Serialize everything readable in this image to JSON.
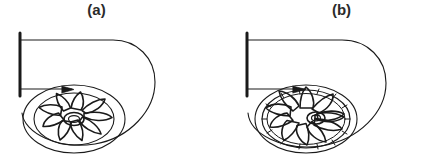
{
  "figure": {
    "background_color": "#ffffff",
    "line_color": "#1a1a1a",
    "label_color": "#2b2b2b",
    "panel_count": 2
  },
  "panels": [
    {
      "id": "a",
      "label": "(a)",
      "impeller_type": "backward-curved",
      "blade_count": 9,
      "description": "Centrifugal fan with volute casing and backward-curved impeller blades",
      "parts": {
        "discharge_flange": "discharge-flange",
        "discharge_duct": "discharge-duct",
        "volute_casing": "volute-casing",
        "cutwater_tongue": "cutwater-tongue",
        "impeller": "impeller",
        "hub": "hub"
      },
      "geometry": {
        "flange_x": 20,
        "flange_top_y": 33,
        "flange_bottom_y": 96,
        "duct_top_y": 40,
        "duct_bottom_y": 89,
        "impeller_center_x": 74,
        "impeller_center_y": 119,
        "impeller_rx": 40,
        "impeller_ry": 26,
        "shroud_rx": 51,
        "shroud_ry": 34,
        "hub_rx": 10,
        "hub_ry": 6.5
      }
    },
    {
      "id": "b",
      "label": "(b)",
      "impeller_type": "forward-curved",
      "blade_count": 11,
      "description": "Centrifugal fan with volute casing and forward-curved impeller blades",
      "parts": {
        "discharge_flange": "discharge-flange",
        "discharge_duct": "discharge-duct",
        "volute_casing": "volute-casing",
        "cutwater_tongue": "cutwater-tongue",
        "impeller": "impeller",
        "hub": "hub"
      },
      "geometry": {
        "flange_x": 31,
        "flange_top_y": 33,
        "flange_bottom_y": 96,
        "duct_top_y": 40,
        "duct_bottom_y": 89,
        "impeller_center_x": 90,
        "impeller_center_y": 119,
        "impeller_rx": 42,
        "impeller_ry": 28,
        "shroud_rx": 51,
        "shroud_ry": 34,
        "hub_rx": 9,
        "hub_ry": 6
      }
    }
  ]
}
